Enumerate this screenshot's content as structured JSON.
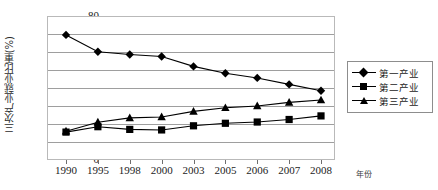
{
  "chart_data": {
    "type": "line",
    "title": "",
    "xlabel": "年份",
    "ylabel": "三次产业就业比重(%)",
    "categories": [
      "1990",
      "1995",
      "1998",
      "2000",
      "2003",
      "2005",
      "2006",
      "2007",
      "2008"
    ],
    "ylim": [
      0,
      80
    ],
    "ytick_step": 10,
    "yticks": [
      "80",
      "70",
      "60",
      "50",
      "40",
      "30",
      "20",
      "10",
      "0"
    ],
    "grid": true,
    "legend_position": "right",
    "series": [
      {
        "name": "第一产业",
        "marker": "diamond",
        "color": "#000000",
        "values": [
          69.5,
          60.1,
          58.6,
          57.5,
          52.0,
          48.2,
          45.6,
          42.0,
          38.5
        ]
      },
      {
        "name": "第二产业",
        "marker": "square",
        "color": "#000000",
        "values": [
          15.5,
          18.5,
          17.0,
          16.7,
          19.0,
          20.4,
          21.1,
          22.5,
          24.5
        ]
      },
      {
        "name": "第三产业",
        "marker": "triangle",
        "color": "#000000",
        "values": [
          16.0,
          21.0,
          23.4,
          23.9,
          27.0,
          29.0,
          30.0,
          32.0,
          33.3
        ]
      }
    ]
  },
  "axis": {
    "y_title": "三次产业就业比重(%)",
    "x_unit": "年份"
  },
  "legend": {
    "items": [
      {
        "label": "第一产业",
        "marker": "diamond-marker"
      },
      {
        "label": "第二产业",
        "marker": "square-marker"
      },
      {
        "label": "第三产业",
        "marker": "triangle-marker"
      }
    ]
  },
  "colors": {
    "line": "#000000",
    "grid": "#9e9e9e",
    "frame": "#b9b9b9",
    "background": "#ffffff"
  }
}
